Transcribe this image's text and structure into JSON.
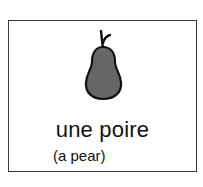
{
  "card": {
    "image": {
      "icon": "pear-icon",
      "fill_color": "#666666",
      "outline_color": "#111111"
    },
    "word": "une poire",
    "translation": "(a pear)"
  }
}
